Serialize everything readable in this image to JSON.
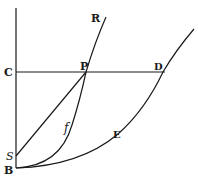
{
  "diagram": {
    "labels": {
      "R": "R",
      "C": "C",
      "P": "P",
      "D": "D",
      "S": "S",
      "B": "B",
      "E": "E",
      "f": "f"
    },
    "points": {
      "B": [
        16,
        168
      ],
      "S": [
        16,
        156
      ],
      "C": [
        16,
        72
      ],
      "P": [
        86,
        72
      ],
      "D": [
        163,
        72
      ],
      "R_end": [
        106,
        18
      ],
      "outer_end": [
        194,
        30
      ]
    },
    "elements": [
      "vertical axis line through C, S, B",
      "horizontal line C to D through P",
      "straight line S to P",
      "inner curve B through f, P to R",
      "outer curve B through E, D"
    ],
    "colors": {
      "ink": "#1a1a1a",
      "paper": "#ffffff"
    }
  }
}
